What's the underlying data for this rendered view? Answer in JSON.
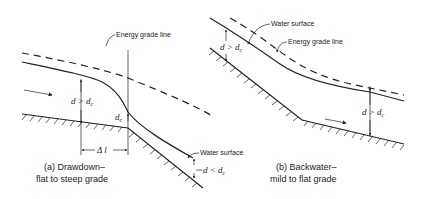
{
  "figure_a": {
    "caption_line1": "(a) Drawdown–",
    "caption_line2": "flat to steep grade",
    "labels": {
      "energy_grade_line": "Energy grade line",
      "water_surface": "Water surface",
      "depth_upstream": "d > d",
      "depth_upstream_sub": "c",
      "critical_depth": "d",
      "critical_depth_sub": "c",
      "delta_l": "Δ l",
      "depth_downstream": "d < d",
      "depth_downstream_sub": "c"
    }
  },
  "figure_b": {
    "caption_line1": "(b) Backwater–",
    "caption_line2": "mild to flat grade",
    "labels": {
      "water_surface": "Water surface",
      "energy_grade_line": "Energy grade line",
      "depth_upstream": "d > d",
      "depth_upstream_sub": "c",
      "depth_downstream": "d > d",
      "depth_downstream_sub": "c"
    }
  },
  "icons": {
    "flow_arrow": "flow-direction-arrow",
    "ground_hatch": "ground-hatching"
  }
}
